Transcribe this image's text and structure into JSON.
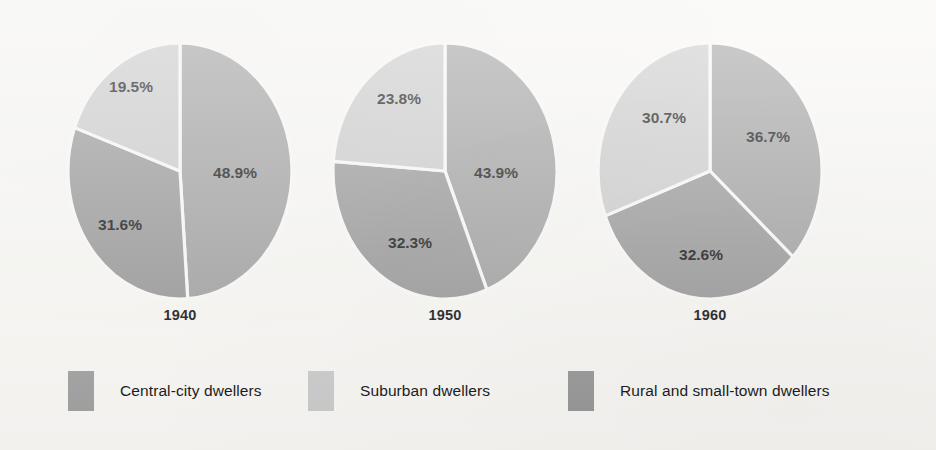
{
  "chart_data": {
    "type": "pie",
    "title": "",
    "subtitle": "",
    "xlabel": "",
    "ylabel": "",
    "legend_position": "bottom",
    "grid": false,
    "value_suffix": "%",
    "categories": [
      "Central-city dwellers",
      "Suburban dwellers",
      "Rural and small-town dwellers"
    ],
    "charts": [
      {
        "label": "1940",
        "slices": [
          {
            "name": "Central-city dwellers",
            "value": 48.9,
            "display": "48.9%",
            "color": "#9d9d9d"
          },
          {
            "name": "Rural and small-town dwellers",
            "value": 31.6,
            "display": "31.6%",
            "color": "#949494"
          },
          {
            "name": "Suburban dwellers",
            "value": 19.5,
            "display": "19.5%",
            "color": "#c9c9c9"
          }
        ]
      },
      {
        "label": "1950",
        "slices": [
          {
            "name": "Central-city dwellers",
            "value": 43.9,
            "display": "43.9%",
            "color": "#9d9d9d"
          },
          {
            "name": "Rural and small-town dwellers",
            "value": 32.3,
            "display": "32.3%",
            "color": "#949494"
          },
          {
            "name": "Suburban dwellers",
            "value": 23.8,
            "display": "23.8%",
            "color": "#c9c9c9"
          }
        ]
      },
      {
        "label": "1960",
        "slices": [
          {
            "name": "Central-city dwellers",
            "value": 36.7,
            "display": "36.7%",
            "color": "#9d9d9d"
          },
          {
            "name": "Rural and small-town dwellers",
            "value": 32.6,
            "display": "32.6%",
            "color": "#949494"
          },
          {
            "name": "Suburban dwellers",
            "value": 30.7,
            "display": "30.7%",
            "color": "#c9c9c9"
          }
        ]
      }
    ],
    "legend": [
      {
        "label": "Central-city dwellers",
        "color": "#9d9d9d"
      },
      {
        "label": "Suburban dwellers",
        "color": "#c9c9c9"
      },
      {
        "label": "Rural and small-town dwellers",
        "color": "#949494"
      }
    ]
  },
  "years": {
    "y1940": "1940",
    "y1950": "1950",
    "y1960": "1960"
  },
  "pies": {
    "p1940": {
      "central": "48.9%",
      "rural": "31.6%",
      "suburban": "19.5%"
    },
    "p1950": {
      "central": "43.9%",
      "rural": "32.3%",
      "suburban": "23.8%"
    },
    "p1960": {
      "central": "36.7%",
      "rural": "32.6%",
      "suburban": "30.7%"
    }
  },
  "legend": {
    "central_label": "Central-city dwellers",
    "suburban_label": "Suburban dwellers",
    "rural_label": "Rural and small-town dwellers"
  },
  "colors": {
    "central": "#9d9d9d",
    "suburban": "#c9c9c9",
    "rural": "#949494",
    "separator": "#f9f8f6",
    "background": "#f7f6f3",
    "text": "#0b0b0b"
  }
}
